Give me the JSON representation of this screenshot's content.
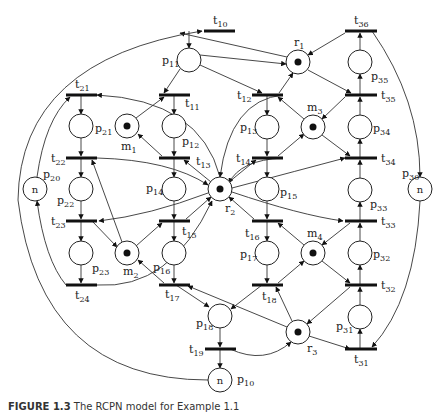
{
  "caption": {
    "prefix": "FIGURE 1.3",
    "text": "The RCPN model for Example 1.1"
  },
  "places": [
    {
      "id": "p11",
      "x": 189,
      "y": 60,
      "label": "p",
      "sub": "11",
      "lx": 162,
      "ly": 64,
      "token": false,
      "inner": ""
    },
    {
      "id": "r1",
      "x": 298,
      "y": 62,
      "label": "r",
      "sub": "1",
      "lx": 294,
      "ly": 46,
      "token": true,
      "inner": ""
    },
    {
      "id": "p35",
      "x": 360,
      "y": 62,
      "label": "p",
      "sub": "35",
      "lx": 371,
      "ly": 80,
      "token": false,
      "inner": ""
    },
    {
      "id": "p21",
      "x": 81,
      "y": 126,
      "label": "p",
      "sub": "21",
      "lx": 95,
      "ly": 132,
      "token": false,
      "inner": ""
    },
    {
      "id": "m1",
      "x": 127,
      "y": 126,
      "label": "m",
      "sub": "1",
      "lx": 121,
      "ly": 150,
      "token": true,
      "inner": ""
    },
    {
      "id": "p12",
      "x": 174,
      "y": 126,
      "label": "p",
      "sub": "12",
      "lx": 182,
      "ly": 145,
      "token": false,
      "inner": ""
    },
    {
      "id": "p13",
      "x": 267,
      "y": 127,
      "label": "p",
      "sub": "13",
      "lx": 240,
      "ly": 131,
      "token": false,
      "inner": ""
    },
    {
      "id": "m3",
      "x": 313,
      "y": 127,
      "label": "m",
      "sub": "3",
      "lx": 307,
      "ly": 111,
      "token": true,
      "inner": ""
    },
    {
      "id": "p34",
      "x": 360,
      "y": 127,
      "label": "p",
      "sub": "34",
      "lx": 373,
      "ly": 132,
      "token": false,
      "inner": ""
    },
    {
      "id": "p20",
      "x": 35,
      "y": 189,
      "label": "p",
      "sub": "20",
      "lx": 43,
      "ly": 178,
      "token": false,
      "inner": "n"
    },
    {
      "id": "p22",
      "x": 81,
      "y": 189,
      "label": "p",
      "sub": "22",
      "lx": 57,
      "ly": 204,
      "token": false,
      "inner": ""
    },
    {
      "id": "p14",
      "x": 174,
      "y": 189,
      "label": "p",
      "sub": "14",
      "lx": 146,
      "ly": 192,
      "token": false,
      "inner": ""
    },
    {
      "id": "r2",
      "x": 220,
      "y": 189,
      "label": "r",
      "sub": "2",
      "lx": 225,
      "ly": 212,
      "token": true,
      "inner": ""
    },
    {
      "id": "p15",
      "x": 267,
      "y": 189,
      "label": "p",
      "sub": "15",
      "lx": 280,
      "ly": 196,
      "token": false,
      "inner": ""
    },
    {
      "id": "p33",
      "x": 360,
      "y": 190,
      "label": "p",
      "sub": "33",
      "lx": 370,
      "ly": 208,
      "token": false,
      "inner": ""
    },
    {
      "id": "p30",
      "x": 420,
      "y": 189,
      "label": "p",
      "sub": "30",
      "lx": 402,
      "ly": 177,
      "token": false,
      "inner": "n"
    },
    {
      "id": "p23",
      "x": 81,
      "y": 253,
      "label": "p",
      "sub": "23",
      "lx": 92,
      "ly": 272,
      "token": false,
      "inner": ""
    },
    {
      "id": "m2",
      "x": 127,
      "y": 253,
      "label": "m",
      "sub": "2",
      "lx": 123,
      "ly": 275,
      "token": true,
      "inner": ""
    },
    {
      "id": "p16",
      "x": 174,
      "y": 253,
      "label": "p",
      "sub": "16",
      "lx": 153,
      "ly": 271,
      "token": false,
      "inner": ""
    },
    {
      "id": "p17",
      "x": 267,
      "y": 253,
      "label": "p",
      "sub": "17",
      "lx": 240,
      "ly": 258,
      "token": false,
      "inner": ""
    },
    {
      "id": "m4",
      "x": 313,
      "y": 253,
      "label": "m",
      "sub": "4",
      "lx": 307,
      "ly": 237,
      "token": true,
      "inner": ""
    },
    {
      "id": "p32",
      "x": 360,
      "y": 253,
      "label": "p",
      "sub": "32",
      "lx": 373,
      "ly": 258,
      "token": false,
      "inner": ""
    },
    {
      "id": "p18",
      "x": 220,
      "y": 316,
      "label": "p",
      "sub": "18",
      "lx": 196,
      "ly": 327,
      "token": false,
      "inner": ""
    },
    {
      "id": "r3",
      "x": 298,
      "y": 332,
      "label": "r",
      "sub": "3",
      "lx": 307,
      "ly": 352,
      "token": true,
      "inner": ""
    },
    {
      "id": "p31",
      "x": 360,
      "y": 317,
      "label": "p",
      "sub": "31",
      "lx": 336,
      "ly": 330,
      "token": false,
      "inner": ""
    },
    {
      "id": "p10",
      "x": 220,
      "y": 380,
      "label": "p",
      "sub": "10",
      "lx": 237,
      "ly": 383,
      "token": false,
      "inner": "n"
    }
  ],
  "transitions": [
    {
      "id": "t10",
      "x1": 204,
      "x2": 235,
      "y": 31,
      "label": "t",
      "sub": "10",
      "lx": 213,
      "ly": 24
    },
    {
      "id": "t36",
      "x1": 345,
      "x2": 377,
      "y": 31,
      "label": "t",
      "sub": "36",
      "lx": 354,
      "ly": 24
    },
    {
      "id": "t21",
      "x1": 66,
      "x2": 97,
      "y": 95,
      "label": "t",
      "sub": "21",
      "lx": 75,
      "ly": 88
    },
    {
      "id": "t11",
      "x1": 159,
      "x2": 190,
      "y": 95,
      "label": "t",
      "sub": "11",
      "lx": 185,
      "ly": 107
    },
    {
      "id": "t12",
      "x1": 252,
      "x2": 283,
      "y": 95,
      "label": "t",
      "sub": "12",
      "lx": 237,
      "ly": 99
    },
    {
      "id": "t35",
      "x1": 345,
      "x2": 377,
      "y": 95,
      "label": "t",
      "sub": "35",
      "lx": 381,
      "ly": 99
    },
    {
      "id": "t22",
      "x1": 66,
      "x2": 97,
      "y": 158,
      "label": "t",
      "sub": "22",
      "lx": 51,
      "ly": 162
    },
    {
      "id": "t13",
      "x1": 159,
      "x2": 190,
      "y": 158,
      "label": "t",
      "sub": "13",
      "lx": 196,
      "ly": 165
    },
    {
      "id": "t14",
      "x1": 252,
      "x2": 283,
      "y": 158,
      "label": "t",
      "sub": "14",
      "lx": 236,
      "ly": 162
    },
    {
      "id": "t34",
      "x1": 345,
      "x2": 377,
      "y": 158,
      "label": "t",
      "sub": "34",
      "lx": 381,
      "ly": 162
    },
    {
      "id": "t23",
      "x1": 66,
      "x2": 97,
      "y": 221,
      "label": "t",
      "sub": "23",
      "lx": 51,
      "ly": 225
    },
    {
      "id": "t15",
      "x1": 159,
      "x2": 190,
      "y": 221,
      "label": "t",
      "sub": "15",
      "lx": 182,
      "ly": 235
    },
    {
      "id": "t16",
      "x1": 252,
      "x2": 283,
      "y": 221,
      "label": "t",
      "sub": "16",
      "lx": 245,
      "ly": 237
    },
    {
      "id": "t33",
      "x1": 345,
      "x2": 377,
      "y": 221,
      "label": "t",
      "sub": "33",
      "lx": 381,
      "ly": 225
    },
    {
      "id": "t24",
      "x1": 66,
      "x2": 97,
      "y": 285,
      "label": "t",
      "sub": "24",
      "lx": 75,
      "ly": 299
    },
    {
      "id": "t17",
      "x1": 159,
      "x2": 190,
      "y": 285,
      "label": "t",
      "sub": "17",
      "lx": 165,
      "ly": 298
    },
    {
      "id": "t18",
      "x1": 252,
      "x2": 283,
      "y": 285,
      "label": "t",
      "sub": "18",
      "lx": 262,
      "ly": 300
    },
    {
      "id": "t32",
      "x1": 345,
      "x2": 377,
      "y": 285,
      "label": "t",
      "sub": "32",
      "lx": 381,
      "ly": 289
    },
    {
      "id": "t19",
      "x1": 205,
      "x2": 236,
      "y": 349,
      "label": "t",
      "sub": "19",
      "lx": 189,
      "ly": 353
    },
    {
      "id": "t31",
      "x1": 345,
      "x2": 377,
      "y": 349,
      "label": "t",
      "sub": "31",
      "lx": 354,
      "ly": 363
    }
  ]
}
